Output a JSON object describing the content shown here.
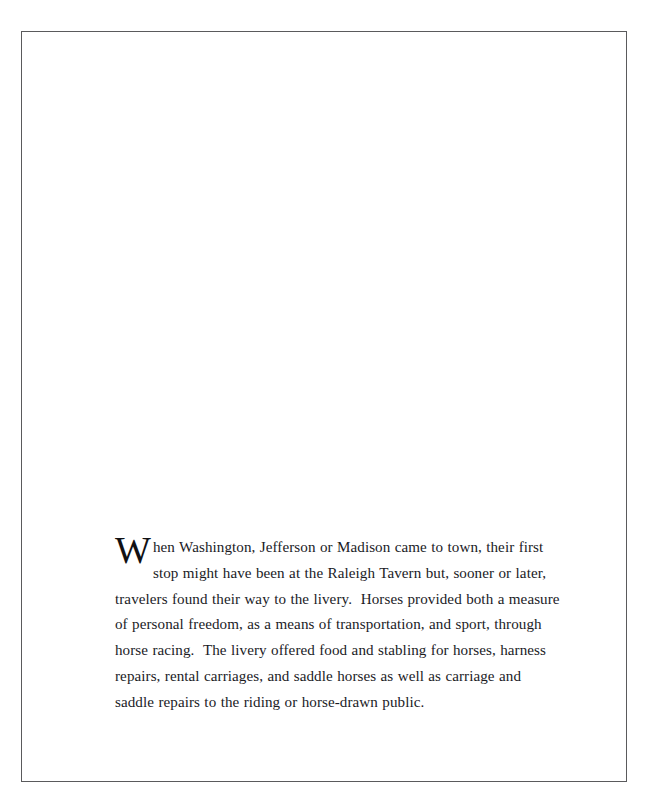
{
  "page": {
    "background_color": "#ffffff",
    "frame_color": "#5a5a5c",
    "text_color": "#1b1b1f"
  },
  "content": {
    "paragraph": {
      "dropcap": "W",
      "body": "hen Washington, Jefferson or Madison came to town, their first stop might have been at the Raleigh Tavern but, sooner or later, travelers found their way to the livery.  Horses provided both a measure of personal freedom, as a means of transportation, and sport, through horse racing.  The livery offered food and stabling for horses, harness repairs, rental carriages, and saddle horses as well as carriage and saddle repairs to the riding or horse-drawn public."
    }
  }
}
